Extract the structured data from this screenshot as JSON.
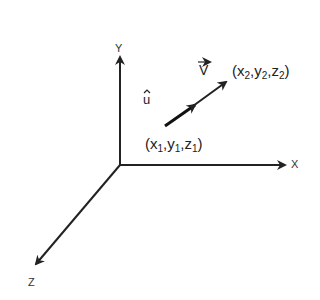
{
  "diagram": {
    "type": "3d-coordinate-vector",
    "axes": {
      "y_label": "Y",
      "x_label": "X",
      "z_label": "Z"
    },
    "vector": {
      "label": "V",
      "unit_label": "u",
      "start_point": {
        "x": "x",
        "xs": "1",
        "y": "y",
        "ys": "1",
        "z": "z",
        "zs": "1"
      },
      "end_point": {
        "x": "x",
        "xs": "2",
        "y": "y",
        "ys": "2",
        "z": "z",
        "zs": "2"
      }
    },
    "colors": {
      "line": "#222222",
      "background": "#ffffff"
    }
  }
}
